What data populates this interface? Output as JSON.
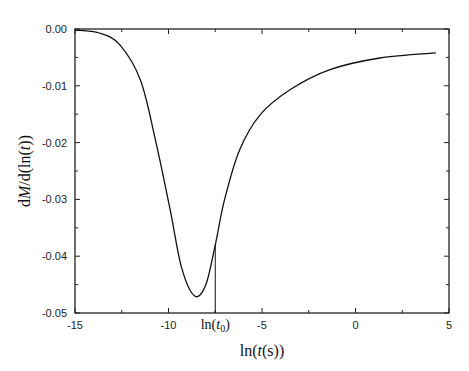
{
  "chart_data": {
    "type": "line",
    "title": "",
    "xlabel": "ln(t(s))",
    "ylabel": "dM/d(ln(t))",
    "xlim": [
      -15,
      5
    ],
    "ylim": [
      -0.05,
      0.0
    ],
    "x_ticks": [
      -15,
      -10,
      -5,
      0,
      5
    ],
    "x_tick_labels": [
      "-15",
      "-10",
      "-5",
      "0",
      "5"
    ],
    "y_ticks": [
      0.0,
      -0.01,
      -0.02,
      -0.03,
      -0.04,
      -0.05
    ],
    "y_tick_labels": [
      "0.00",
      "-0.01",
      "-0.02",
      "-0.03",
      "-0.04",
      "-0.05"
    ],
    "grid": false,
    "legend": null,
    "series": [
      {
        "name": "dM/d(ln(t))",
        "x": [
          -15,
          -13.7,
          -12.6,
          -11.5,
          -10.7,
          -9.9,
          -9.3,
          -8.6,
          -8.0,
          -7.5,
          -7.0,
          -6.2,
          -5.1,
          -3.5,
          -1.4,
          1.3,
          4.3
        ],
        "y": [
          -0.0002,
          -0.0007,
          -0.0028,
          -0.009,
          -0.0195,
          -0.032,
          -0.042,
          -0.047,
          -0.045,
          -0.038,
          -0.03,
          -0.0213,
          -0.0151,
          -0.0107,
          -0.0072,
          -0.0051,
          -0.0042
        ]
      }
    ],
    "annotations": [
      {
        "type": "vline",
        "x": -7.5,
        "y_from": -0.05,
        "y_to": -0.038,
        "label": "ln(t0)"
      }
    ]
  },
  "labels": {
    "x_axis_prefix": "ln(",
    "x_axis_var": "t",
    "x_axis_suffix": "(s))",
    "y_axis_prefix": "d",
    "y_axis_var": "M",
    "y_axis_mid": "/d(ln(",
    "y_axis_var2": "t",
    "y_axis_suffix": "))",
    "annot_prefix": "ln(",
    "annot_var": "t",
    "annot_sub": "0",
    "annot_suffix": ")"
  }
}
